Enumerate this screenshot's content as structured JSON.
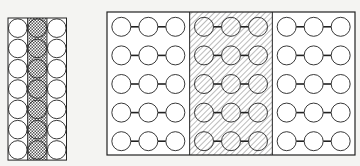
{
  "diagram": {
    "left_panel": {
      "columns": 3,
      "rows": 7,
      "shaded_column": 1,
      "shading": "crosshatch"
    },
    "right_panel": {
      "sections": 3,
      "rows_per_section": 5,
      "circles_per_chain": 3,
      "shaded_section": 1,
      "shading": "diagonal-hatch"
    },
    "colors": {
      "line": "#222222",
      "background": "#f4f4f2",
      "fill": "#ffffff"
    }
  }
}
